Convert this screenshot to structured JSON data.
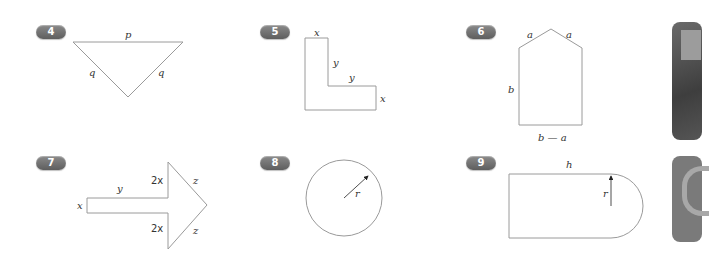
{
  "problems": [
    {
      "number": "4",
      "shape": "isosceles-triangle",
      "labels": {
        "top": "p",
        "left": "q",
        "right": "q"
      }
    },
    {
      "number": "5",
      "shape": "L-shape",
      "labels": {
        "top": "x",
        "inner_vertical": "y",
        "inner_horizontal": "y",
        "right": "x"
      }
    },
    {
      "number": "6",
      "shape": "pentagon-house",
      "labels": {
        "roof_left": "a",
        "roof_right": "a",
        "left": "b",
        "bottom": "b — a"
      }
    },
    {
      "number": "7",
      "shape": "arrow",
      "labels": {
        "shaft_end": "x",
        "shaft_length": "y",
        "head_top": "2x",
        "head_bottom": "2x",
        "tip_top": "z",
        "tip_bottom": "z"
      }
    },
    {
      "number": "8",
      "shape": "circle",
      "labels": {
        "radius": "r"
      }
    },
    {
      "number": "9",
      "shape": "rectangle-with-semicircle",
      "labels": {
        "top": "h",
        "radius": "r"
      }
    }
  ],
  "colors": {
    "outline": "#9a9a9a",
    "badge": "#6e6e6e",
    "text": "#333333"
  }
}
